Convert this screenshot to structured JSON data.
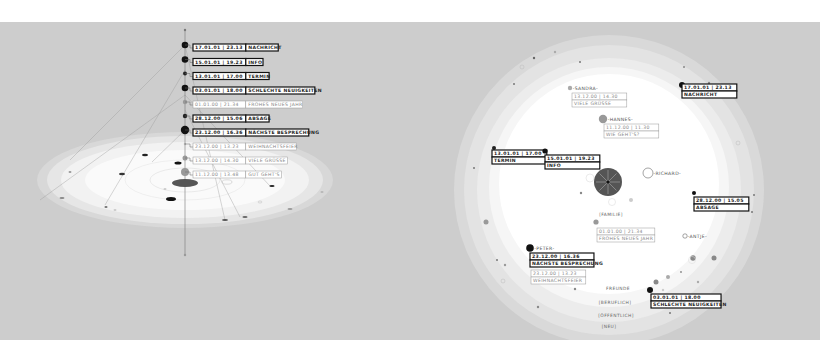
{
  "colors": {
    "background": "#cdcdcd",
    "ring_outer": "#dadada",
    "ring_mid": "#e4e4e4",
    "ring_inner": "#eeeeee",
    "core": "#ffffff",
    "dot_dark": "#111111",
    "dot_mid": "#8a8a8a",
    "hub": "#555555"
  },
  "timeline": {
    "messages": [
      {
        "date": "17.01.01 | 23.13",
        "subject": "NACHRICHT",
        "weight": "dark"
      },
      {
        "date": "15.01.01 | 19.23",
        "subject": "INFO",
        "weight": "dark"
      },
      {
        "date": "13.01.01 | 17.00",
        "subject": "TERMIN",
        "weight": "dark"
      },
      {
        "date": "03.01.01 | 18.00",
        "subject": "SCHLECHTE NEUIGKEITEN",
        "weight": "dark"
      },
      {
        "date": "01.01.00 | 21.34",
        "subject": "FROHES NEUES JAHR",
        "weight": "light"
      },
      {
        "date": "28.12.00 | 15.06",
        "subject": "ABSAGE",
        "weight": "dark"
      },
      {
        "date": "23.12.00 | 16.36",
        "subject": "NÄCHSTE BESPRECHUNG",
        "weight": "dark"
      },
      {
        "date": "23.12.00 | 13.23",
        "subject": "WEIHNACHTSFEIER",
        "weight": "light"
      },
      {
        "date": "13.12.00 | 14.30",
        "subject": "VIELE GRÜSSE",
        "weight": "light"
      },
      {
        "date": "11.12.00 | 13.48",
        "subject": "GUT GEHT'S",
        "weight": "light"
      }
    ]
  },
  "radial": {
    "contacts": [
      {
        "name": "-SANDRA-"
      },
      {
        "name": "-HANNES-"
      },
      {
        "name": "-RICHARD-"
      },
      {
        "name": "-ANTJE-"
      },
      {
        "name": "-PETER-"
      }
    ],
    "messages": [
      {
        "date": "13.12.00 | 14.30",
        "subject": "VIELE GRÜSSE",
        "weight": "light"
      },
      {
        "date": "11.12.00 | 11.30",
        "subject": "WIE GEHT'S?",
        "weight": "light"
      },
      {
        "date": "17.01.01 | 23.13",
        "subject": "NACHRICHT",
        "weight": "dark"
      },
      {
        "date": "13.01.01 | 17.00",
        "subject": "TERMIN",
        "weight": "dark"
      },
      {
        "date": "15.01.01 | 19.23",
        "subject": "INFO",
        "weight": "dark"
      },
      {
        "date": "28.12.00 | 15.05",
        "subject": "ABSAGE",
        "weight": "dark"
      },
      {
        "date": "01.01.00 | 21.34",
        "subject": "FROHES NEUES JAHR",
        "weight": "light"
      },
      {
        "date": "23.12.00 | 16.36",
        "subject": "NÄCHSTE BESPRECHUNG",
        "weight": "dark"
      },
      {
        "date": "23.12.00 | 13.23",
        "subject": "WEIHNACHTSFEIER",
        "weight": "light"
      },
      {
        "date": "03.01.01 | 18.00",
        "subject": "SCHLECHTE NEUIGKEITEN",
        "weight": "dark"
      }
    ],
    "rings": [
      "[FAMILIE]",
      "FREUNDE",
      "[BERUFLICH]",
      "[ÖFFENTLICH]",
      "[NEU]"
    ]
  }
}
